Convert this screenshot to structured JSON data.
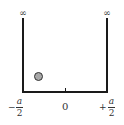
{
  "diagram": {
    "type": "infinite-square-well",
    "walls": {
      "left_label": "∞",
      "right_label": "∞"
    },
    "axis": {
      "left": {
        "sign": "−",
        "numerator": "a",
        "denominator": "2"
      },
      "center": "0",
      "right": {
        "sign": "+",
        "numerator": "a",
        "denominator": "2"
      }
    },
    "particle": {
      "fill": "#a8a8a8",
      "stroke": "#333333"
    },
    "line_color": "#1a1a1a"
  }
}
